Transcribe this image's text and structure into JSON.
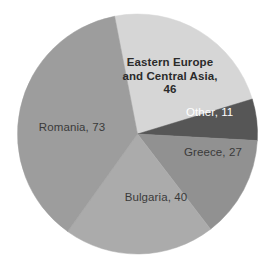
{
  "chart_data": {
    "type": "pie",
    "title": "",
    "total": 197,
    "legend_position": "none",
    "grid": false,
    "labels_inside": true,
    "categories": [
      "Eastern Europe and Central Asia",
      "Other",
      "Greece",
      "Bulgaria",
      "Romania"
    ],
    "values": [
      46,
      11,
      27,
      40,
      73
    ],
    "slices": [
      {
        "name": "Eastern Europe and Central Asia",
        "value": 46,
        "label": "Eastern Europe\nand Central Asia,\n46",
        "color": "#d6d6d6",
        "label_color": "#2b2b2b",
        "start_angle": -11.0,
        "sweep_angle": 84.06
      },
      {
        "name": "Other",
        "value": 11,
        "label": "Other, 11",
        "color": "#565656",
        "label_color": "#ffffff",
        "start_angle": 73.06,
        "sweep_angle": 20.1
      },
      {
        "name": "Greece",
        "value": 27,
        "label": "Greece, 27",
        "color": "#919191",
        "label_color": "#3a3a3a",
        "start_angle": 93.16,
        "sweep_angle": 49.34
      },
      {
        "name": "Bulgaria",
        "value": 40,
        "label": "Bulgaria, 40",
        "color": "#ababab",
        "label_color": "#3a3a3a",
        "start_angle": 142.5,
        "sweep_angle": 73.1
      },
      {
        "name": "Romania",
        "value": 73,
        "label": "Romania, 73",
        "color": "#9d9d9d",
        "label_color": "#3a3a3a",
        "start_angle": 215.6,
        "sweep_angle": 133.4
      }
    ],
    "geometry": {
      "center_x": 137.5,
      "center_y": 134,
      "radius": 120
    },
    "background_color": "#ffffff"
  }
}
